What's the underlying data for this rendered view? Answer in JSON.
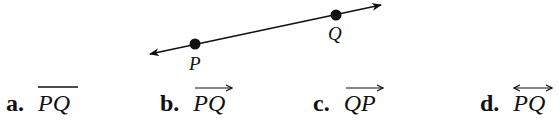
{
  "figure": {
    "line": {
      "x1": 150,
      "y1": 54,
      "x2": 381,
      "y2": 5
    },
    "points": [
      {
        "name": "P",
        "x": 195,
        "y": 44,
        "label_x": 188,
        "label_y": 53
      },
      {
        "name": "Q",
        "x": 336,
        "y": 15,
        "label_x": 328,
        "label_y": 23
      }
    ]
  },
  "options": [
    {
      "letter": "a.",
      "symbol": "PQ",
      "notation": "segment"
    },
    {
      "letter": "b.",
      "symbol": "PQ",
      "notation": "ray"
    },
    {
      "letter": "c.",
      "symbol": "QP",
      "notation": "ray"
    },
    {
      "letter": "d.",
      "symbol": "PQ",
      "notation": "line"
    }
  ]
}
